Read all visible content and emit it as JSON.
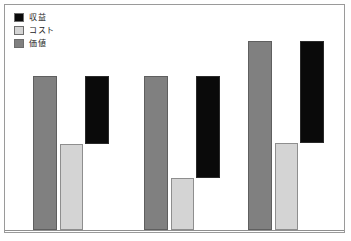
{
  "chart_data": {
    "type": "bar",
    "title": "",
    "subtitle": "",
    "xlabel": "",
    "ylabel": "",
    "grid": false,
    "legend_position": "top-left",
    "axis": {
      "baseline_visible": true,
      "tick_labels": [],
      "ylim": [
        0,
        200
      ]
    },
    "categories": [
      "1",
      "2",
      "3"
    ],
    "series": [
      {
        "name": "価値",
        "color": "#808080",
        "values": [
          154,
          154,
          189
        ],
        "base": [
          0,
          0,
          0
        ]
      },
      {
        "name": "コスト",
        "color": "#d4d4d4",
        "values": [
          86,
          52,
          87
        ],
        "base": [
          0,
          0,
          0
        ]
      },
      {
        "name": "収益",
        "color": "#0a0a0a",
        "values": [
          68,
          102,
          102
        ],
        "base": [
          86,
          52,
          87
        ]
      }
    ]
  },
  "legend": {
    "items": [
      {
        "label": "収益",
        "color": "#0a0a0a"
      },
      {
        "label": "コスト",
        "color": "#d4d4d4"
      },
      {
        "label": "価値",
        "color": "#808080"
      }
    ]
  },
  "colors": {
    "frame_border": "#9a9a9a",
    "background": "#ffffff",
    "baseline": "#8f8f8f",
    "revenue": "#0a0a0a",
    "cost": "#d4d4d4",
    "value": "#808080"
  },
  "geometry": {
    "baseline_y": 225,
    "groups": [
      {
        "value": {
          "x": 28,
          "top": 71,
          "w": 24
        },
        "cost": {
          "x": 55,
          "top": 139,
          "w": 23
        },
        "revenue": {
          "x": 80,
          "top": 71,
          "w": 24,
          "bottom": 139
        }
      },
      {
        "value": {
          "x": 139,
          "top": 71,
          "w": 24
        },
        "cost": {
          "x": 166,
          "top": 173,
          "w": 23
        },
        "revenue": {
          "x": 191,
          "top": 71,
          "w": 24,
          "bottom": 173
        }
      },
      {
        "value": {
          "x": 243,
          "top": 36,
          "w": 24
        },
        "cost": {
          "x": 270,
          "top": 138,
          "w": 23
        },
        "revenue": {
          "x": 295,
          "top": 36,
          "w": 24,
          "bottom": 138
        }
      }
    ]
  }
}
